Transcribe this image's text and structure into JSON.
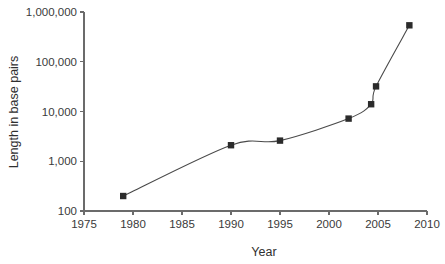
{
  "chart_data": {
    "type": "line",
    "title": "",
    "xlabel": "Year",
    "ylabel": "Length in base pairs",
    "xlim": [
      1975,
      2010
    ],
    "ylim": [
      100,
      1000000
    ],
    "yscale": "log",
    "xscale": "linear",
    "grid": false,
    "legend": null,
    "xticks": [
      1975,
      1980,
      1985,
      1990,
      1995,
      2000,
      2005,
      2010
    ],
    "xticklabels": [
      "1975",
      "1980",
      "1985",
      "1990",
      "1995",
      "2000",
      "2005",
      "2010"
    ],
    "yticks": [
      100,
      1000,
      10000,
      100000,
      1000000
    ],
    "yticklabels": [
      "100",
      "1,000",
      "10,000",
      "100,000",
      "1,000,000"
    ],
    "marker": "square",
    "series": [
      {
        "name": "",
        "x": [
          1979,
          1990,
          1995,
          2002,
          2004.3,
          2004.8,
          2008.2
        ],
        "y": [
          200,
          2100,
          2600,
          7200,
          14000,
          32000,
          540000
        ]
      }
    ],
    "colors": {
      "line": "#4a4a4a",
      "marker": "#2b2b2b",
      "axis": "#6b6b6b",
      "text": "#3a3a3a",
      "background": "#ffffff"
    }
  }
}
